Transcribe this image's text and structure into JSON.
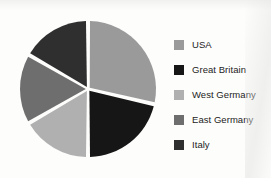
{
  "chart_data": {
    "type": "pie",
    "title": "",
    "categories": [
      "USA",
      "Great Britain",
      "West Germany",
      "East Germany",
      "Italy"
    ],
    "values": [
      28.6,
      21.4,
      16.7,
      16.7,
      16.7
    ],
    "unit": "percent",
    "start_angle_deg": 0,
    "direction": "clockwise",
    "slice_boundaries_deg": [
      0,
      103,
      180,
      240,
      300,
      360
    ],
    "colors": [
      "#9a9a9a",
      "#161616",
      "#b0b0b0",
      "#6e6e6e",
      "#2f2f2f"
    ],
    "legend_position": "right",
    "grid": false,
    "xlabel": "",
    "ylabel": "",
    "data_labels_shown": false,
    "slice_gap": true
  },
  "legend": {
    "items": [
      {
        "label": "USA",
        "color": "#9a9a9a",
        "swatch": "legend-swatch-usa"
      },
      {
        "label": "Great Britain",
        "color": "#161616",
        "swatch": "legend-swatch-great-britain"
      },
      {
        "label": "West Germany",
        "color": "#b0b0b0",
        "swatch": "legend-swatch-west-germany"
      },
      {
        "label": "East Germany",
        "color": "#6e6e6e",
        "swatch": "legend-swatch-east-germany"
      },
      {
        "label": "Italy",
        "color": "#2f2f2f",
        "swatch": "legend-swatch-italy"
      }
    ]
  },
  "figure": {
    "background_color": "#fdfdfc",
    "separator_color": "#ffffff"
  }
}
